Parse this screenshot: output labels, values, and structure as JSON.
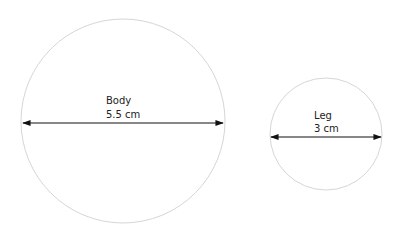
{
  "diagram": {
    "colors": {
      "circle_stroke": "#d6d6d6",
      "arrow": "#111111",
      "text": "#222222"
    },
    "circles": [
      {
        "id": "body",
        "label": "Body",
        "measurement": "5.5 cm"
      },
      {
        "id": "leg",
        "label": "Leg",
        "measurement": "3 cm"
      }
    ]
  }
}
